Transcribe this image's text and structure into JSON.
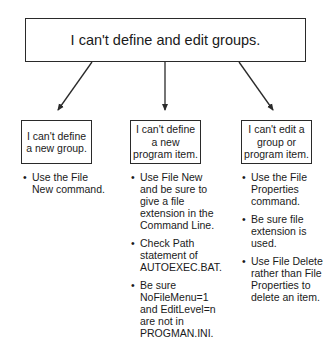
{
  "diagram": {
    "root": {
      "label": "I can't define and edit groups."
    },
    "branches": [
      {
        "label": "I can't define a new group.",
        "bullets": [
          "Use the File New command."
        ]
      },
      {
        "label": "I can't define a new program item.",
        "bullets": [
          "Use File New and be sure to give a file extension in the Command Line.",
          "Check Path statement of AUTOEXEC.BAT.",
          "Be sure NoFileMenu=1 and EditLevel=n are not in PROGMAN.INI."
        ]
      },
      {
        "label": "I can't edit a group or program item.",
        "bullets": [
          "Use the File Properties command.",
          "Be sure file extension is used.",
          "Use File Delete rather than File Properties to delete an item."
        ]
      }
    ],
    "bullet_glyph": "•",
    "colors": {
      "line": "#2a2a2a",
      "text": "#1a1a1a",
      "background": "#ffffff"
    }
  }
}
